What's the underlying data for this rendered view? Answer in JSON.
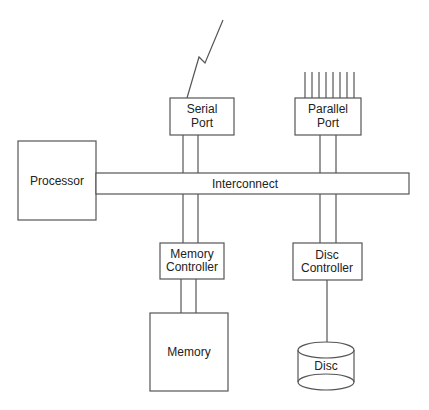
{
  "diagram": {
    "type": "computer-architecture-block-diagram",
    "nodes": {
      "serial_port": {
        "line1": "Serial",
        "line2": "Port"
      },
      "parallel_port": {
        "line1": "Parallel",
        "line2": "Port"
      },
      "processor": {
        "label": "Processor"
      },
      "interconnect": {
        "label": "Interconnect"
      },
      "memory_controller": {
        "line1": "Memory",
        "line2": "Controller"
      },
      "disc_controller": {
        "line1": "Disc",
        "line2": "Controller"
      },
      "memory": {
        "label": "Memory"
      },
      "disc": {
        "label": "Disc"
      }
    },
    "edges": [
      {
        "from": "serial_port",
        "to": "external-lightning-link",
        "style": "zigzag"
      },
      {
        "from": "parallel_port",
        "to": "external-parallel-lines",
        "count": 8
      },
      {
        "from": "serial_port",
        "to": "interconnect",
        "style": "double-line"
      },
      {
        "from": "parallel_port",
        "to": "interconnect",
        "style": "double-line"
      },
      {
        "from": "processor",
        "to": "interconnect",
        "style": "bus"
      },
      {
        "from": "interconnect",
        "to": "memory_controller",
        "style": "double-line"
      },
      {
        "from": "interconnect",
        "to": "disc_controller",
        "style": "double-line"
      },
      {
        "from": "memory_controller",
        "to": "memory",
        "style": "double-line"
      },
      {
        "from": "disc_controller",
        "to": "disc",
        "style": "single-line"
      }
    ],
    "colors": {
      "stroke": "#555555",
      "text": "#222222",
      "background": "#ffffff"
    }
  }
}
